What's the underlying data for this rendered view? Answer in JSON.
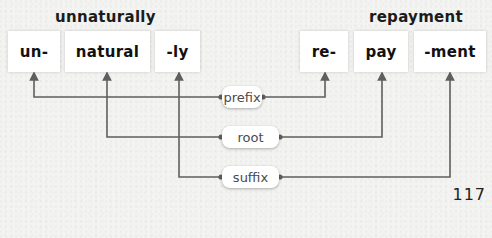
{
  "words": [
    {
      "label": "unnaturally",
      "parts": [
        {
          "text": "un-",
          "type": "prefix"
        },
        {
          "text": "natural",
          "type": "root"
        },
        {
          "text": "-ly",
          "type": "suffix"
        }
      ]
    },
    {
      "label": "repayment",
      "parts": [
        {
          "text": "re-",
          "type": "prefix"
        },
        {
          "text": "pay",
          "type": "root"
        },
        {
          "text": "-ment",
          "type": "suffix"
        }
      ]
    }
  ],
  "categories": [
    {
      "label": "prefix"
    },
    {
      "label": "root"
    },
    {
      "label": "suffix"
    }
  ],
  "page_number": "117",
  "colors": {
    "line": "#5f5f5f",
    "box": "#ffffff",
    "background": "#f3f3f2",
    "text": "#111111"
  }
}
